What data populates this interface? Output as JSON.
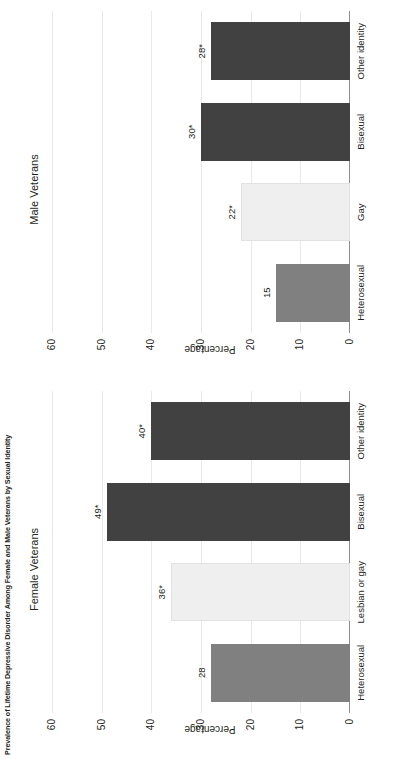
{
  "figure": {
    "title": "Prevalence of Lifetime Depressive Disorder Among Female and Male Veterans by Sexual Identity",
    "colors": {
      "dark_bar": "#414141",
      "mid_bar": "#808080",
      "light_bar": "#efefef",
      "gridline": "#e8e8e8",
      "axis": "#8c8c8c",
      "text": "#231f20"
    }
  },
  "panels": [
    {
      "key": "female",
      "title": "Female Veterans",
      "ylabel": "Percentage"
    },
    {
      "key": "male",
      "title": "Male Veterans",
      "ylabel": "Percentage"
    }
  ],
  "ticks": {
    "labels": [
      "60",
      "50",
      "40",
      "30",
      "20",
      "10",
      "0"
    ],
    "values": [
      60,
      50,
      40,
      30,
      20,
      10,
      0
    ]
  },
  "chart_data": [
    {
      "type": "bar",
      "title": "Female Veterans",
      "xlabel": "",
      "ylabel": "Percentage",
      "ylim": [
        0,
        60
      ],
      "grid": true,
      "legend": "none",
      "orientation": "vertical",
      "categories": [
        "Heterosexual",
        "Lesbian or gay",
        "Bisexual",
        "Other identity"
      ],
      "values": [
        28,
        36,
        49,
        40
      ],
      "data_labels": [
        "28",
        "36*",
        "49*",
        "40*"
      ],
      "bar_colors": [
        "#808080",
        "#efefef",
        "#414141",
        "#414141"
      ]
    },
    {
      "type": "bar",
      "title": "Male Veterans",
      "xlabel": "",
      "ylabel": "Percentage",
      "ylim": [
        0,
        60
      ],
      "grid": true,
      "legend": "none",
      "orientation": "vertical",
      "categories": [
        "Heterosexual",
        "Gay",
        "Bisexual",
        "Other identity"
      ],
      "values": [
        15,
        22,
        30,
        28
      ],
      "data_labels": [
        "15",
        "22*",
        "30*",
        "28*"
      ],
      "bar_colors": [
        "#808080",
        "#efefef",
        "#414141",
        "#414141"
      ]
    }
  ]
}
